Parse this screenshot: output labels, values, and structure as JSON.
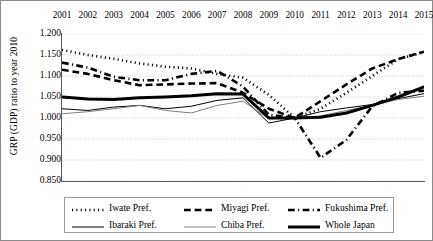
{
  "chart_data": {
    "type": "line",
    "title": "",
    "xlabel": "",
    "ylabel": "GRP (GDP) ratio to year 2010",
    "x": [
      2001,
      2002,
      2003,
      2004,
      2005,
      2006,
      2007,
      2008,
      2009,
      2010,
      2011,
      2012,
      2013,
      2014,
      2015
    ],
    "categories": [
      "2001",
      "2002",
      "2003",
      "2004",
      "2005",
      "2006",
      "2007",
      "2008",
      "2009",
      "2010",
      "2011",
      "2012",
      "2013",
      "2014",
      "2015"
    ],
    "ylim": [
      0.85,
      1.2
    ],
    "yticks": [
      0.85,
      0.9,
      0.95,
      1.0,
      1.05,
      1.1,
      1.15,
      1.2
    ],
    "ytick_labels": [
      "0.850",
      "0.900",
      "0.950",
      "1.000",
      "1.050",
      "1.100",
      "1.150",
      "1.200"
    ],
    "xaxis_position": "top",
    "grid": "horizontal-dotted",
    "legend_position": "bottom-inside-box",
    "series": [
      {
        "name": "Iwate Pref.",
        "style": "dotted",
        "width": 2.6,
        "color": "#000000",
        "values": [
          1.162,
          1.15,
          1.141,
          1.13,
          1.122,
          1.118,
          1.105,
          1.096,
          1.055,
          1.0,
          1.022,
          1.06,
          1.1,
          1.14,
          1.157
        ]
      },
      {
        "name": "Miyagi Pref.",
        "style": "dashed",
        "width": 2.6,
        "color": "#000000",
        "values": [
          1.115,
          1.105,
          1.09,
          1.078,
          1.08,
          1.082,
          1.083,
          1.06,
          1.022,
          1.0,
          1.04,
          1.08,
          1.118,
          1.14,
          1.158
        ]
      },
      {
        "name": "Fukushima Pref.",
        "style": "dash-dot",
        "width": 2.6,
        "color": "#000000",
        "values": [
          1.132,
          1.12,
          1.098,
          1.09,
          1.09,
          1.105,
          1.112,
          1.075,
          1.008,
          1.0,
          0.905,
          0.948,
          1.028,
          1.06,
          1.065
        ]
      },
      {
        "name": "Ibaraki Pref.",
        "style": "solid",
        "width": 1.0,
        "color": "#000000",
        "values": [
          1.022,
          1.018,
          1.026,
          1.03,
          1.022,
          1.028,
          1.042,
          1.048,
          0.988,
          1.0,
          1.015,
          1.024,
          1.032,
          1.046,
          1.058
        ]
      },
      {
        "name": "Chiba Pref.",
        "style": "solid",
        "width": 1.0,
        "color": "#7f7f7f",
        "values": [
          1.01,
          1.015,
          1.022,
          1.03,
          1.018,
          1.012,
          1.03,
          1.04,
          0.998,
          1.0,
          1.005,
          1.018,
          1.03,
          1.044,
          1.052
        ]
      },
      {
        "name": "Whole Japan",
        "style": "solid",
        "width": 3.0,
        "color": "#000000",
        "values": [
          1.05,
          1.045,
          1.044,
          1.048,
          1.05,
          1.053,
          1.058,
          1.057,
          1.0,
          1.0,
          1.002,
          1.012,
          1.03,
          1.05,
          1.074
        ]
      }
    ]
  },
  "legend": {
    "rows": [
      [
        {
          "label": "Iwate Pref.",
          "series": 0
        },
        {
          "label": "Miyagi Pref.",
          "series": 1
        },
        {
          "label": "Fukushima Pref.",
          "series": 2
        }
      ],
      [
        {
          "label": "Ibaraki Pref.",
          "series": 3
        },
        {
          "label": "Chiba Pref.",
          "series": 4
        },
        {
          "label": "Whole Japan",
          "series": 5
        }
      ]
    ]
  }
}
